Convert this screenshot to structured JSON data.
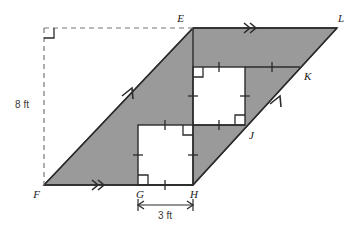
{
  "figure": {
    "background": "#ffffff",
    "shade_color": "#9a9a9a",
    "line_color": "#2b2b2b",
    "white_fill": "#ffffff",
    "dash_color": "#777777"
  },
  "vertices": {
    "E": {
      "label": "E",
      "x": 193,
      "y": 28,
      "label_x": 184,
      "label_y": 20
    },
    "L": {
      "label": "L",
      "x": 337,
      "y": 28,
      "label_x": 338,
      "label_y": 20
    },
    "K": {
      "label": "K",
      "x": 300,
      "y": 67,
      "label_x": 303,
      "label_y": 78
    },
    "J": {
      "label": "J",
      "x": 245,
      "y": 125,
      "label_x": 248,
      "label_y": 137
    },
    "F": {
      "label": "F",
      "x": 44,
      "y": 185,
      "label_x": 35,
      "label_y": 197
    },
    "G": {
      "label": "G",
      "x": 138,
      "y": 185,
      "label_x": 133,
      "label_y": 197
    },
    "H": {
      "label": "H",
      "x": 193,
      "y": 185,
      "label_x": 190,
      "label_y": 197
    }
  },
  "squares": {
    "lower": {
      "name": "square-GHxx",
      "x": 138,
      "y": 125,
      "size": 55
    },
    "upper": {
      "name": "square-EJxx",
      "x": 193,
      "y": 67,
      "size": 52
    }
  },
  "measurements": {
    "height": {
      "value": "8 ft",
      "x": 22,
      "y": 107
    },
    "base": {
      "value": "3 ft",
      "x": 165,
      "y": 215
    }
  },
  "marks": {
    "parallel_double": "double-chevron",
    "parallel_single": "single-arrow",
    "right_angle": "square-corner",
    "congruent_tick": "single-tick"
  }
}
